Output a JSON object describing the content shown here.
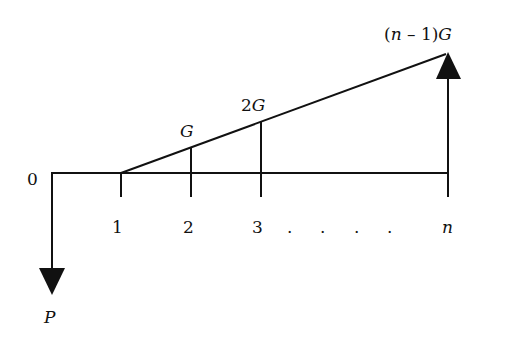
{
  "diagram": {
    "type": "cash-flow-gradient",
    "colors": {
      "stroke": "#111111",
      "background": "#ffffff"
    },
    "labels": {
      "origin": "0",
      "period_1": "1",
      "period_2": "2",
      "period_3": "3",
      "period_n": "n",
      "ellipsis_dot": ".",
      "gradient_1": "G",
      "gradient_2": "2G",
      "gradient_n_prefix": "(",
      "gradient_n_var": "n",
      "gradient_n_mid": " – 1)",
      "gradient_n_suffix": "G",
      "present_value": "P"
    },
    "arrows": {
      "present_value_direction": "down",
      "final_gradient_direction": "up"
    }
  }
}
